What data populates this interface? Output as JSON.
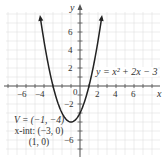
{
  "chart_data": {
    "type": "line",
    "title": "",
    "function": "y = x^2 + 2x - 3",
    "xlabel": "x",
    "ylabel": "y",
    "xlim": [
      -8,
      8.5
    ],
    "ylim": [
      -7.5,
      8.5
    ],
    "grid": true,
    "x_ticks": [
      -6,
      -4,
      2,
      4,
      6
    ],
    "y_ticks": [
      6,
      4,
      2,
      -2,
      -6
    ],
    "origin_label": "0",
    "series": [
      {
        "name": "y = x^2 + 2x - 3",
        "x": [
          -4.4,
          -4,
          -3,
          -2,
          -1,
          0,
          1,
          2,
          2.4
        ],
        "y": [
          7.56,
          5,
          0,
          -3,
          -4,
          -3,
          0,
          5,
          7.56
        ]
      }
    ],
    "annotations": [
      {
        "text": "y = x² + 2x − 3",
        "position": "right of curve near y=2"
      },
      {
        "text": "V = (−1, −4)"
      },
      {
        "text": "x-int: (−3, 0)"
      },
      {
        "text": "(1, 0)"
      }
    ],
    "vertex": [
      -1,
      -4
    ],
    "x_intercepts": [
      [
        -3,
        0
      ],
      [
        1,
        0
      ]
    ]
  },
  "labels": {
    "x_axis": "x",
    "y_axis": "y",
    "origin": "0",
    "xt_m6": "−6",
    "xt_m4": "−4",
    "xt_2": "2",
    "xt_4": "4",
    "xt_6": "6",
    "yt_6": "6",
    "yt_4": "4",
    "yt_2": "2",
    "yt_m2": "−2",
    "yt_m6": "−6",
    "equation": "y = x² + 2x − 3",
    "vertex": "V = (−1, −4)",
    "xint1": "x-int: (−3, 0)",
    "xint2": "(1, 0)"
  },
  "colors": {
    "grid": "#d8d8d8",
    "axis": "#555555",
    "curve": "#222222",
    "text": "#333333"
  }
}
